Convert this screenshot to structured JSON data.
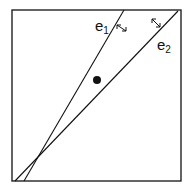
{
  "diagram": {
    "frame": {
      "x1": 12,
      "y1": 10,
      "x2": 181,
      "y2": 181
    },
    "lines": [
      {
        "id": "e1",
        "label": "e",
        "subscript": "1",
        "x1": 124,
        "y1": 10,
        "x2": 24,
        "y2": 181
      },
      {
        "id": "e2",
        "label": "e",
        "subscript": "2",
        "x1": 178,
        "y1": 10,
        "x2": 15,
        "y2": 181
      }
    ],
    "point": {
      "cx": 97,
      "cy": 80,
      "r": 4
    },
    "arrows": [
      {
        "near": "e1",
        "icon": "double-arrow-icon"
      },
      {
        "near": "e2",
        "icon": "double-arrow-icon"
      }
    ],
    "stroke_color": "#111111"
  }
}
